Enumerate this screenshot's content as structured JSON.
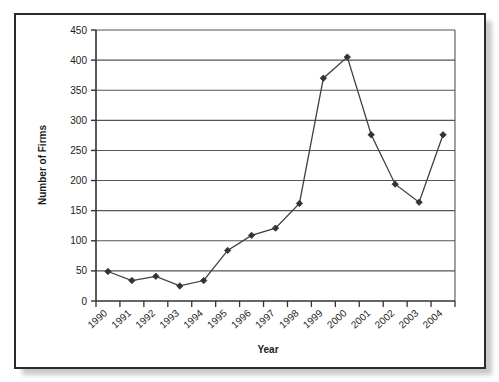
{
  "chart_data": {
    "type": "line",
    "title": "",
    "xlabel": "Year",
    "ylabel": "Number of Firms",
    "categories": [
      "1990",
      "1991",
      "1992",
      "1993",
      "1994",
      "1995",
      "1996",
      "1997",
      "1998",
      "1999",
      "2000",
      "2001",
      "2002",
      "2003",
      "2004"
    ],
    "values": [
      49,
      34,
      41,
      25,
      34,
      84,
      109,
      121,
      162,
      370,
      405,
      276,
      194,
      164,
      276
    ],
    "ylim": [
      0,
      450
    ],
    "ytick_labels": [
      "0",
      "50",
      "100",
      "150",
      "200",
      "250",
      "300",
      "350",
      "400",
      "450"
    ],
    "ytick_values": [
      0,
      50,
      100,
      150,
      200,
      250,
      300,
      350,
      400,
      450
    ],
    "grid": "horizontal",
    "legend": "none",
    "series_name": "Number of Firms",
    "marker": "diamond",
    "line_color": "#404040",
    "marker_color": "#333333",
    "grid_color": "#555555",
    "axis_color": "#333333",
    "frame_color": "#2b2b2b",
    "background": "#ffffff"
  },
  "figure": {
    "border_style": "thin-black-rectangle-with-drop-shadow"
  }
}
